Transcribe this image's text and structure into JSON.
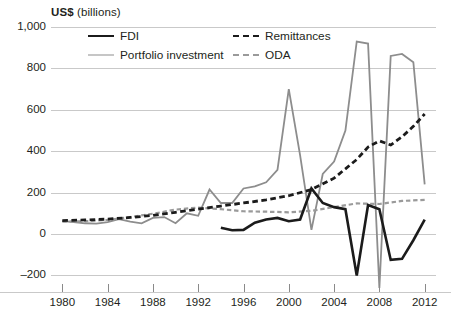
{
  "axis_title": {
    "strong": "US$",
    "light": " (billions)"
  },
  "legend": {
    "position": "top-inside",
    "items": [
      {
        "label": "FDI",
        "style": "solid",
        "color": "#1b1b1b",
        "width": 2.6,
        "icon": "line-swatch-icon"
      },
      {
        "label": "Portfolio investment",
        "style": "solid",
        "color": "#8d8d8d",
        "width": 1.8,
        "icon": "line-swatch-icon"
      },
      {
        "label": "Remittances",
        "style": "dashed",
        "color": "#1b1b1b",
        "width": 2.8,
        "icon": "dashed-line-swatch-icon"
      },
      {
        "label": "ODA",
        "style": "dashed",
        "color": "#9a9a9a",
        "width": 2.2,
        "icon": "dashed-line-swatch-icon"
      }
    ]
  },
  "chart_data": {
    "type": "line",
    "title": "",
    "subtitle": "",
    "xlabel": "",
    "ylabel": "US$ (billions)",
    "xlim": [
      1979,
      2013
    ],
    "ylim": [
      -280,
      1000
    ],
    "xticks": [
      1980,
      1984,
      1988,
      1992,
      1996,
      2000,
      2004,
      2008,
      2012
    ],
    "xtick_labels": [
      "1980",
      "1984",
      "1988",
      "1992",
      "1996",
      "2000",
      "2004",
      "2008",
      "2012"
    ],
    "yticks": [
      -200,
      0,
      200,
      400,
      600,
      800,
      1000
    ],
    "ytick_labels": [
      "–200",
      "0",
      "200",
      "400",
      "600",
      "800",
      "1,000"
    ],
    "grid": "horizontal",
    "series": [
      {
        "name": "FDI",
        "style": "solid",
        "color": "#1b1b1b",
        "width": 2.6,
        "x": [
          1994,
          1995,
          1996,
          1997,
          1998,
          1999,
          2000,
          2001,
          2002,
          2003,
          2004,
          2005,
          2006,
          2007,
          2008,
          2009,
          2010,
          2011,
          2012
        ],
        "y": [
          30,
          18,
          20,
          55,
          70,
          78,
          62,
          70,
          220,
          150,
          130,
          120,
          -200,
          140,
          120,
          -125,
          -120,
          -30,
          70
        ]
      },
      {
        "name": "Portfolio investment",
        "style": "solid",
        "color": "#8d8d8d",
        "width": 1.8,
        "x": [
          1980,
          1981,
          1982,
          1983,
          1984,
          1985,
          1986,
          1987,
          1988,
          1989,
          1990,
          1991,
          1992,
          1993,
          1994,
          1995,
          1996,
          1997,
          1998,
          1999,
          2000,
          2001,
          2002,
          2003,
          2004,
          2005,
          2006,
          2007,
          2008,
          2009,
          2010,
          2011,
          2012
        ],
        "y": [
          62,
          58,
          52,
          50,
          58,
          72,
          60,
          52,
          78,
          82,
          52,
          100,
          88,
          215,
          150,
          150,
          220,
          230,
          250,
          310,
          700,
          380,
          20,
          290,
          350,
          500,
          930,
          920,
          -260,
          860,
          870,
          830,
          240
        ]
      },
      {
        "name": "Remittances",
        "style": "dashed",
        "color": "#1b1b1b",
        "width": 2.8,
        "x": [
          1980,
          1982,
          1984,
          1986,
          1988,
          1990,
          1992,
          1994,
          1996,
          1998,
          2000,
          2002,
          2004,
          2006,
          2007,
          2008,
          2009,
          2010,
          2011,
          2012
        ],
        "y": [
          65,
          68,
          72,
          80,
          90,
          105,
          120,
          135,
          150,
          165,
          185,
          215,
          270,
          360,
          420,
          450,
          430,
          470,
          520,
          580
        ]
      },
      {
        "name": "ODA",
        "style": "dashed",
        "color": "#9a9a9a",
        "width": 2.2,
        "x": [
          1980,
          1982,
          1984,
          1986,
          1988,
          1990,
          1992,
          1994,
          1996,
          1998,
          2000,
          2002,
          2004,
          2006,
          2008,
          2010,
          2012
        ],
        "y": [
          60,
          62,
          68,
          82,
          98,
          118,
          128,
          120,
          110,
          108,
          105,
          112,
          130,
          148,
          145,
          160,
          165
        ]
      }
    ]
  }
}
